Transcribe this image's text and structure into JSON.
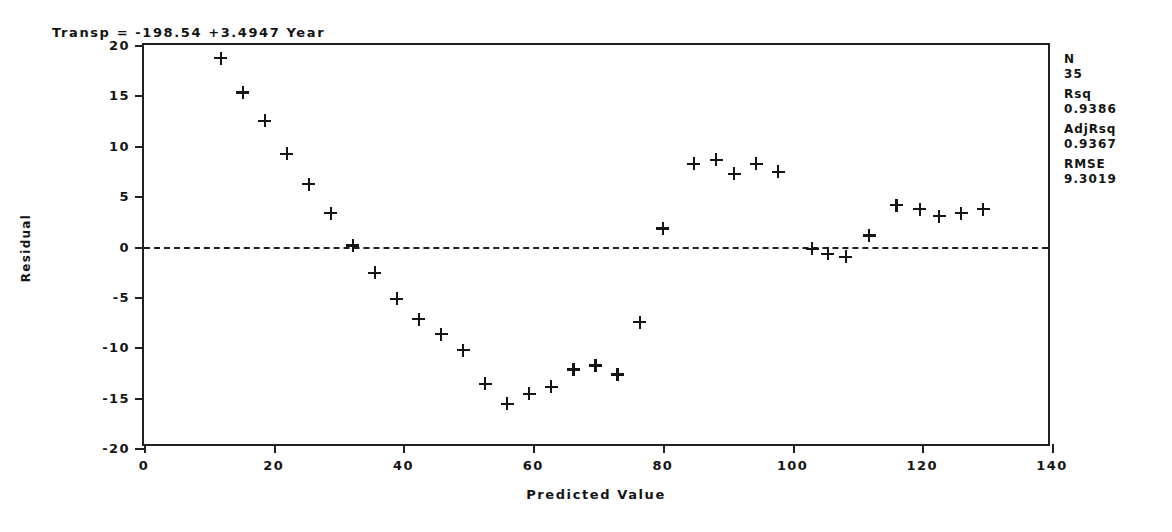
{
  "chart_data": {
    "type": "scatter",
    "title": "Transp = -198.54 +3.4947 Year",
    "xlabel": "Predicted Value",
    "ylabel": "Residual",
    "xlim": [
      0,
      140
    ],
    "ylim": [
      -20,
      20
    ],
    "xticks": [
      "0",
      "20",
      "40",
      "60",
      "80",
      "100",
      "120",
      "140"
    ],
    "xtick_values": [
      0,
      20,
      40,
      60,
      80,
      100,
      120,
      140
    ],
    "yticks": [
      "20",
      "15",
      "10",
      "5",
      "0",
      "-5",
      "-10",
      "-15",
      "-20"
    ],
    "ytick_values": [
      20,
      15,
      10,
      5,
      0,
      -5,
      -10,
      -15,
      -20
    ],
    "grid": false,
    "reference_line": {
      "y": 0,
      "style": "dashed"
    },
    "marker": "plus",
    "marker_color": "#151515",
    "points": [
      {
        "x": 11.8,
        "y": 18.7
      },
      {
        "x": 15.2,
        "y": 15.3
      },
      {
        "x": 18.6,
        "y": 12.5
      },
      {
        "x": 22.0,
        "y": 9.2
      },
      {
        "x": 25.4,
        "y": 6.2
      },
      {
        "x": 28.8,
        "y": 3.3
      },
      {
        "x": 32.2,
        "y": 0.1
      },
      {
        "x": 35.6,
        "y": -2.6
      },
      {
        "x": 39.0,
        "y": -5.2
      },
      {
        "x": 42.4,
        "y": -7.2
      },
      {
        "x": 45.8,
        "y": -8.7
      },
      {
        "x": 49.2,
        "y": -10.3
      },
      {
        "x": 52.6,
        "y": -13.6
      },
      {
        "x": 56.0,
        "y": -15.6
      },
      {
        "x": 59.4,
        "y": -14.6
      },
      {
        "x": 62.8,
        "y": -13.9
      },
      {
        "x": 66.2,
        "y": -12.2
      },
      {
        "x": 69.6,
        "y": -11.8
      },
      {
        "x": 73.0,
        "y": -12.7
      },
      {
        "x": 76.4,
        "y": -7.5
      },
      {
        "x": 80.0,
        "y": 1.8
      },
      {
        "x": 84.8,
        "y": 8.2
      },
      {
        "x": 88.2,
        "y": 8.6
      },
      {
        "x": 91.0,
        "y": 7.2
      },
      {
        "x": 94.4,
        "y": 8.2
      },
      {
        "x": 97.8,
        "y": 7.4
      },
      {
        "x": 103.0,
        "y": -0.2
      },
      {
        "x": 105.4,
        "y": -0.7
      },
      {
        "x": 108.2,
        "y": -1.0
      },
      {
        "x": 111.8,
        "y": 1.1
      },
      {
        "x": 116.0,
        "y": 4.1
      },
      {
        "x": 119.6,
        "y": 3.7
      },
      {
        "x": 122.6,
        "y": 3.0
      },
      {
        "x": 126.0,
        "y": 3.3
      },
      {
        "x": 129.4,
        "y": 3.7
      }
    ]
  },
  "stats": [
    {
      "label": "N",
      "value": "35"
    },
    {
      "label": "Rsq",
      "value": "0.9386"
    },
    {
      "label": "AdjRsq",
      "value": "0.9367"
    },
    {
      "label": "RMSE",
      "value": "9.3019"
    }
  ]
}
